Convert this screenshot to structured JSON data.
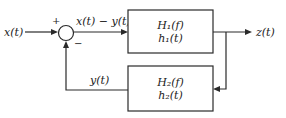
{
  "diagram": {
    "type": "feedback-block-diagram",
    "input_label": "x(t)",
    "output_label": "z(t)",
    "feedback_label": "y(t)",
    "error_label": "x(t) − y(t)",
    "summing_junction": {
      "plus_sign": "+",
      "minus_sign": "−"
    },
    "blocks": [
      {
        "id": "forward",
        "line1": "H₁(f)",
        "line2": "h₁(t)"
      },
      {
        "id": "feedback",
        "line1": "H₂(f)",
        "line2": "h₂(t)"
      }
    ]
  }
}
